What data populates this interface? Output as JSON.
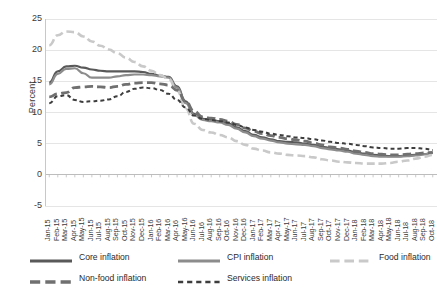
{
  "chart_data": {
    "type": "line",
    "title": "",
    "xlabel": "",
    "ylabel": "Percent",
    "ylim": [
      -5,
      25
    ],
    "ytick_step": 5,
    "yticks": [
      25,
      20,
      15,
      10,
      5,
      0,
      -5
    ],
    "grid": "horizontal",
    "legend_position": "bottom",
    "x": [
      "Jan-15",
      "Feb-15",
      "Mar-15",
      "Apr-15",
      "May-15",
      "Jun-15",
      "Jul-15",
      "Aug-15",
      "Sep-15",
      "Oct-15",
      "Nov-15",
      "Dec-15",
      "Jan-16",
      "Feb-16",
      "Mar-16",
      "Apr-16",
      "May-16",
      "Jun-16",
      "Jul-16",
      "Aug-16",
      "Sep-16",
      "Oct-16",
      "Nov-16",
      "Dec-16",
      "Jan-17",
      "Feb-17",
      "Mar-17",
      "Apr-17",
      "May-17",
      "Jun-17",
      "Jul-17",
      "Aug-17",
      "Sep-17",
      "Oct-17",
      "Nov-17",
      "Dec-17",
      "Jan-18",
      "Feb-18",
      "Mar-18",
      "Apr-18",
      "May-18",
      "Jun-18",
      "Jul-18",
      "Aug-18",
      "Sep-18",
      "Oct-18"
    ],
    "series": [
      {
        "name": "Core inflation",
        "color": "#595959",
        "style": "solid",
        "width": 2.2,
        "values": [
          14.8,
          16.6,
          17.4,
          17.5,
          17.2,
          16.9,
          16.7,
          16.6,
          16.6,
          16.6,
          16.6,
          16.5,
          16.2,
          15.9,
          15.7,
          14.2,
          11.8,
          9.8,
          9.0,
          8.8,
          8.6,
          8.2,
          7.6,
          7.0,
          6.4,
          6.0,
          5.7,
          5.4,
          5.3,
          5.2,
          5.0,
          4.8,
          4.5,
          4.3,
          4.1,
          3.9,
          3.6,
          3.4,
          3.2,
          3.1,
          3.0,
          3.0,
          3.1,
          3.2,
          3.3,
          3.5
        ]
      },
      {
        "name": "CPI inflation",
        "color": "#8c8c8c",
        "style": "solid",
        "width": 2.2,
        "values": [
          14.5,
          16.2,
          17.0,
          17.1,
          16.3,
          15.6,
          15.6,
          15.6,
          15.8,
          16.0,
          16.1,
          16.1,
          16.0,
          15.8,
          15.6,
          14.0,
          11.5,
          9.6,
          8.8,
          8.6,
          8.4,
          8.0,
          7.4,
          6.8,
          6.2,
          5.8,
          5.5,
          5.2,
          5.0,
          4.9,
          4.8,
          4.6,
          4.3,
          4.1,
          3.9,
          3.7,
          3.4,
          3.2,
          3.0,
          2.9,
          2.9,
          2.9,
          3.0,
          3.1,
          3.3,
          3.5
        ]
      },
      {
        "name": "Food inflation",
        "color": "#c9c9c9",
        "style": "dash-long",
        "width": 2.6,
        "values": [
          20.8,
          22.4,
          23.0,
          22.9,
          22.2,
          21.4,
          20.7,
          20.1,
          19.5,
          18.8,
          18.1,
          17.4,
          16.7,
          16.0,
          15.4,
          13.5,
          10.6,
          8.2,
          7.2,
          6.8,
          6.4,
          6.0,
          5.4,
          4.8,
          4.2,
          3.9,
          3.6,
          3.4,
          3.2,
          3.1,
          3.0,
          2.8,
          2.5,
          2.3,
          2.1,
          2.0,
          1.9,
          1.8,
          1.8,
          1.8,
          1.9,
          2.1,
          2.3,
          2.6,
          2.9,
          3.2
        ]
      },
      {
        "name": "Non-food inflation",
        "color": "#707070",
        "style": "dash-long",
        "width": 2.8,
        "values": [
          12.5,
          13.0,
          13.2,
          14.0,
          14.1,
          14.2,
          14.1,
          14.0,
          14.2,
          14.5,
          14.7,
          14.8,
          14.8,
          14.6,
          14.4,
          13.6,
          11.8,
          10.2,
          9.3,
          9.1,
          8.9,
          8.6,
          8.1,
          7.5,
          7.0,
          6.6,
          6.3,
          6.0,
          5.8,
          5.6,
          5.4,
          5.1,
          4.8,
          4.5,
          4.3,
          4.1,
          3.8,
          3.6,
          3.4,
          3.3,
          3.2,
          3.2,
          3.3,
          3.4,
          3.5,
          3.6
        ]
      },
      {
        "name": "Services inflation",
        "color": "#3d3d3d",
        "style": "dash-short",
        "width": 2.0,
        "values": [
          11.5,
          12.6,
          12.8,
          12.0,
          11.7,
          11.8,
          11.9,
          12.1,
          12.6,
          13.3,
          13.8,
          14.0,
          13.9,
          13.6,
          13.0,
          12.0,
          10.8,
          9.5,
          9.0,
          8.8,
          8.6,
          8.4,
          8.0,
          7.6,
          7.2,
          6.9,
          6.6,
          6.4,
          6.2,
          6.0,
          5.9,
          5.7,
          5.5,
          5.3,
          5.1,
          5.0,
          4.8,
          4.6,
          4.4,
          4.3,
          4.2,
          4.2,
          4.3,
          4.3,
          4.2,
          4.0
        ]
      }
    ]
  }
}
